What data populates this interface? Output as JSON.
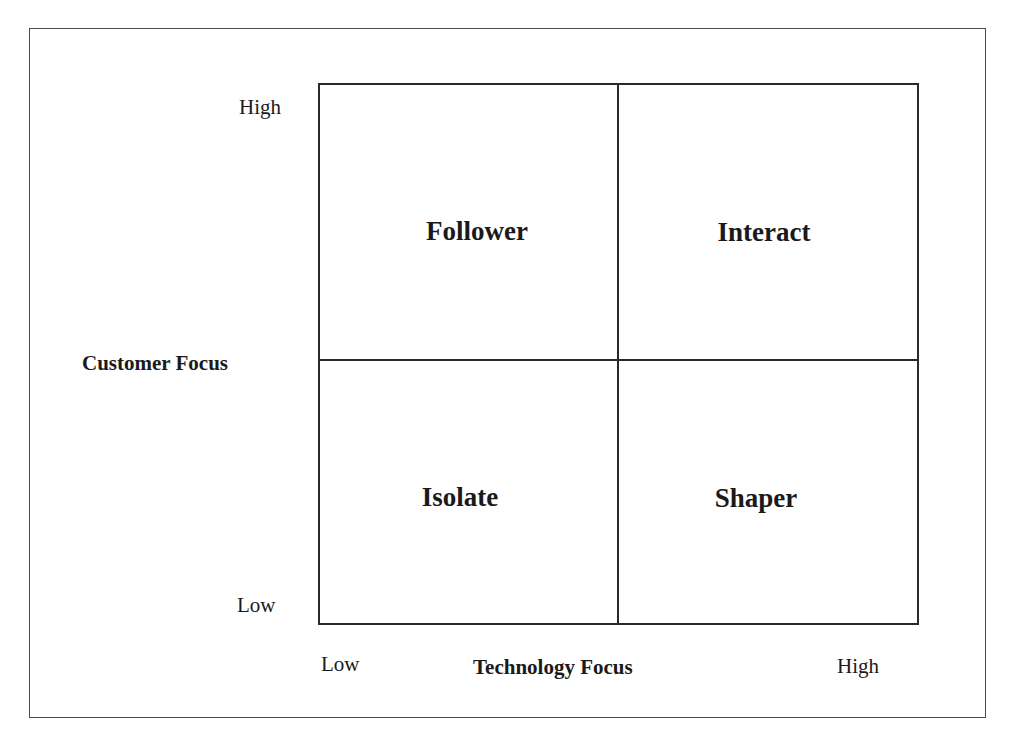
{
  "y_axis": {
    "label": "Customer Focus",
    "high": "High",
    "low": "Low"
  },
  "x_axis": {
    "label": "Technology Focus",
    "low": "Low",
    "high": "High"
  },
  "quadrants": {
    "top_left": "Follower",
    "top_right": "Interact",
    "bottom_left": "Isolate",
    "bottom_right": "Shaper"
  }
}
